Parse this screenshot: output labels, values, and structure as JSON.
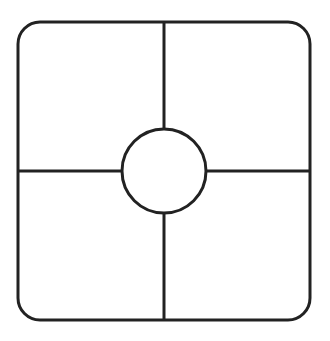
{
  "diagram": {
    "stroke_color": "#222222",
    "fill_color": "#ffffff",
    "outer_rect": {
      "x": 18,
      "y": 22,
      "width": 292,
      "height": 298,
      "radius": 22
    },
    "center_circle": {
      "cx": 164,
      "cy": 171,
      "r": 42
    },
    "quadrants": [
      "top-left",
      "top-right",
      "bottom-left",
      "bottom-right"
    ]
  }
}
